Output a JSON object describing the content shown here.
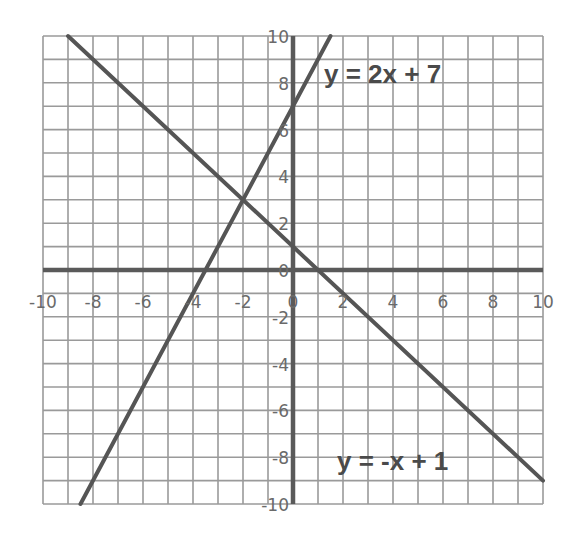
{
  "chart_data": {
    "type": "line",
    "title": "",
    "xlabel": "",
    "ylabel": "",
    "xlim": [
      -10,
      10
    ],
    "ylim": [
      -10,
      10
    ],
    "grid": true,
    "grid_step": 1,
    "x_ticks": [
      -10,
      -8,
      -6,
      -4,
      -2,
      0,
      2,
      4,
      6,
      8,
      10
    ],
    "y_ticks": [
      -10,
      -8,
      -6,
      -4,
      -2,
      0,
      2,
      4,
      6,
      8,
      10
    ],
    "x_tick_labels": [
      "-10",
      "-8",
      "-6",
      "-4",
      "-2",
      "0",
      "2",
      "4",
      "6",
      "8",
      "10"
    ],
    "y_tick_labels": [
      "10",
      "8",
      "6",
      "4",
      "2",
      "0",
      "-2",
      "-4",
      "-6",
      "-8",
      "-10"
    ],
    "series": [
      {
        "name": "y = 2x + 7",
        "slope": 2,
        "intercept": 7,
        "x": [
          -8.5,
          1.5
        ],
        "values": [
          -10,
          10
        ]
      },
      {
        "name": "y = -x + 1",
        "slope": -1,
        "intercept": 1,
        "x": [
          -9,
          10
        ],
        "values": [
          10,
          -9
        ]
      }
    ],
    "annotations": [
      {
        "text": "y = 2x + 7",
        "x": 1.3,
        "y": 8.2
      },
      {
        "text": "y = -x + 1",
        "x": 1.8,
        "y": -8.2
      }
    ],
    "intersection": {
      "x": -2,
      "y": 3
    }
  },
  "labels": {
    "eq1": "y = 2x + 7",
    "eq2": "y = -x + 1",
    "x_ticks": [
      "-10",
      "-8",
      "-6",
      "-4",
      "-2",
      "0",
      "2",
      "4",
      "6",
      "8",
      "10"
    ],
    "y_ticks": [
      "10",
      "8",
      "6",
      "4",
      "2",
      "0",
      "-2",
      "-4",
      "-6",
      "-8",
      "-10"
    ]
  },
  "colors": {
    "grid": "#9a9a9a",
    "axis": "#5a5a5a",
    "line": "#555555",
    "text": "#6a6a6a",
    "equation": "#4a4a4a"
  }
}
